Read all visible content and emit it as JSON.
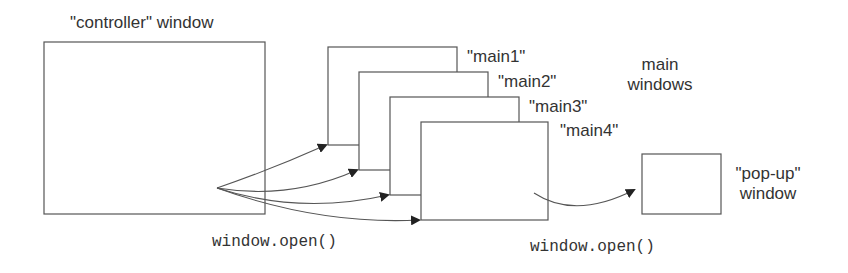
{
  "diagram": {
    "controller": {
      "label": "\"controller\" window"
    },
    "mains": [
      {
        "label": "\"main1\""
      },
      {
        "label": "\"main2\""
      },
      {
        "label": "\"main3\""
      },
      {
        "label": "\"main4\""
      }
    ],
    "main_group_label_line1": "main",
    "main_group_label_line2": "windows",
    "popup": {
      "label_line1": "\"pop-up\"",
      "label_line2": "window"
    },
    "call_left": "window.open()",
    "call_right": "window.open()",
    "colors": {
      "stroke": "#555555",
      "text": "#333333",
      "background": "#ffffff"
    }
  }
}
